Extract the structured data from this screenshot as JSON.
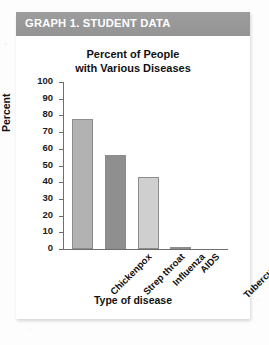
{
  "banner": {
    "title": "GRAPH 1. STUDENT DATA",
    "bg_color": "#9a9a9a",
    "text_color": "#ffffff"
  },
  "chart_data": {
    "type": "bar",
    "title": "Percent of People with Various Diseases",
    "title_line1": "Percent of People",
    "title_line2": "with Various Diseases",
    "xlabel": "Type of disease",
    "ylabel": "Percent",
    "ylim": [
      0,
      100
    ],
    "ytick_step": 10,
    "ytick_labels": [
      "100",
      "90",
      "80",
      "70",
      "60",
      "50",
      "40",
      "30",
      "20",
      "10",
      "0"
    ],
    "grid": false,
    "legend": "none",
    "categories": [
      "Chickenpox",
      "Strep throat",
      "Influenza",
      "AIDS",
      "Tuberculosis"
    ],
    "values": [
      78,
      56,
      43,
      1,
      0
    ],
    "bar_colors": [
      "#b2b2b2",
      "#8f8f8f",
      "#cfcfcf",
      "#9a9a9a",
      "#cfcfcf"
    ],
    "bar_border_color": "#8d8d8d"
  }
}
